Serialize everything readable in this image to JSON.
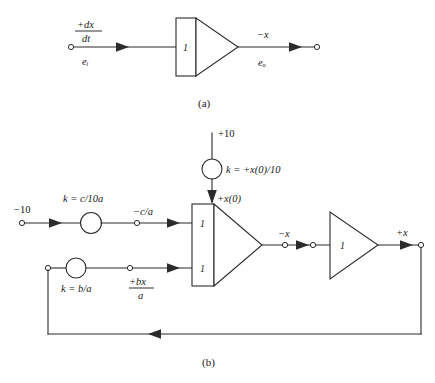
{
  "figure": {
    "background_color": "#ffffff",
    "line_color": "#2b2b2b",
    "text_color": "#1a1a1a"
  },
  "panel_a": {
    "caption": "(a)",
    "input_terminal_label_top_numerator": "+dx",
    "input_terminal_label_top_denominator": "dt",
    "input_terminal_label_bottom": "eᵢ",
    "integrator_gain": "1",
    "output_label_top": "−x",
    "output_label_bottom": "eₒ"
  },
  "panel_b": {
    "caption": "(b)",
    "ic_source_label": "+10",
    "ic_pot_label": "k = +x(0)/10",
    "ic_output_label": "+x(0)",
    "input_source_label": "−10",
    "input_pot_label": "k = c/10a",
    "input_pot_output_label": "−c/a",
    "feedback_pot_label": "k = b/a",
    "feedback_pot_output_numerator": "+bx",
    "feedback_pot_output_denominator": "a",
    "integrator_gain_top": "1",
    "integrator_gain_bottom": "1",
    "integrator_output_label": "−x",
    "inverter_gain": "1",
    "inverter_output_label": "+x"
  },
  "icons": {
    "potentiometer": "potentiometer-circle-icon",
    "terminal": "terminal-node-icon",
    "arrow": "signal-flow-arrow-icon"
  }
}
